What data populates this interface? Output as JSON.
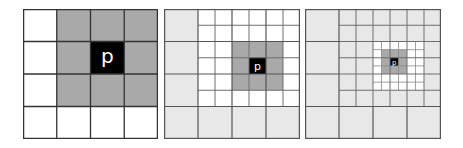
{
  "figure": {
    "center_label": "p",
    "colors": {
      "background": "#ffffff",
      "neighbor_gray": "#a9a9a9",
      "outer_light": "#e8e8e8",
      "center_black": "#000000",
      "line_dark": "#333333",
      "line_mid": "#6e6e6e"
    },
    "panels": [
      {
        "name": "coarse-grid",
        "grid": "4x4",
        "center_label": "p"
      },
      {
        "name": "medium-grid",
        "grid": "4x4 with 6x6 refined inner region",
        "center_label": "p"
      },
      {
        "name": "fine-grid",
        "grid": "4x4 with two refinement levels",
        "center_label": "p"
      }
    ]
  }
}
